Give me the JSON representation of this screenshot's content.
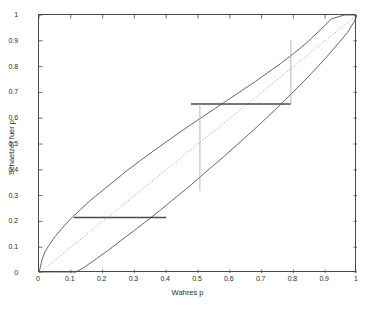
{
  "chart_data": {
    "type": "line",
    "title": "",
    "xlabel": "Wahres p",
    "ylabel": "Schaetzer fuer p",
    "xlim": [
      0,
      1
    ],
    "ylim": [
      0,
      1
    ],
    "grid": false,
    "legend": "none",
    "xticks": [
      "0",
      "0.1",
      "0.2",
      "0.3",
      "0.4",
      "0.5",
      "0.6",
      "0.7",
      "0.8",
      "0.9",
      "1"
    ],
    "xtick_values": [
      0,
      0.1,
      0.2,
      0.3,
      0.4,
      0.5,
      0.6,
      0.7,
      0.8,
      0.9,
      1
    ],
    "yticks": [
      "0",
      "0.1",
      "0.2",
      "0.3",
      "0.4",
      "0.5",
      "0.6",
      "0.7",
      "0.8",
      "0.9",
      "1"
    ],
    "ytick_values": [
      0,
      0.1,
      0.2,
      0.3,
      0.4,
      0.5,
      0.6,
      0.7,
      0.8,
      0.9,
      1
    ],
    "series": [
      {
        "name": "upper-confidence-bound",
        "style": "solid",
        "color": "#555555",
        "x": [
          0.0,
          0.01,
          0.02,
          0.03,
          0.05,
          0.07,
          0.1,
          0.13,
          0.16,
          0.2,
          0.24,
          0.28,
          0.32,
          0.36,
          0.4,
          0.44,
          0.48,
          0.52,
          0.56,
          0.6,
          0.64,
          0.68,
          0.72,
          0.76,
          0.8,
          0.84,
          0.88,
          0.92,
          0.96,
          1.0
        ],
        "y": [
          0.0,
          0.055,
          0.085,
          0.105,
          0.14,
          0.17,
          0.21,
          0.245,
          0.28,
          0.32,
          0.36,
          0.4,
          0.437,
          0.473,
          0.508,
          0.543,
          0.577,
          0.61,
          0.643,
          0.676,
          0.709,
          0.742,
          0.777,
          0.812,
          0.85,
          0.89,
          0.937,
          0.985,
          1.0,
          1.0
        ]
      },
      {
        "name": "lower-confidence-bound",
        "style": "solid",
        "color": "#555555",
        "x": [
          0.0,
          0.04,
          0.08,
          0.11,
          0.14,
          0.18,
          0.22,
          0.26,
          0.3,
          0.34,
          0.38,
          0.42,
          0.46,
          0.5,
          0.54,
          0.58,
          0.62,
          0.66,
          0.7,
          0.74,
          0.78,
          0.82,
          0.86,
          0.9,
          0.94,
          0.97,
          0.99,
          1.0
        ],
        "y": [
          0.0,
          0.0,
          0.0,
          0.0,
          0.02,
          0.055,
          0.09,
          0.128,
          0.165,
          0.203,
          0.242,
          0.283,
          0.323,
          0.365,
          0.408,
          0.45,
          0.494,
          0.538,
          0.583,
          0.63,
          0.678,
          0.727,
          0.778,
          0.831,
          0.888,
          0.932,
          0.972,
          1.0
        ]
      },
      {
        "name": "identity-line",
        "style": "dotted",
        "color": "#8c8c8c",
        "x": [
          0,
          1
        ],
        "y": [
          0,
          1
        ]
      }
    ],
    "annotations": [
      {
        "name": "lower-confidence-interval-segment",
        "type": "hline",
        "y": 0.215,
        "x_start": 0.11,
        "x_end": 0.4,
        "color": "#4a4a4a"
      },
      {
        "name": "upper-confidence-interval-segment",
        "type": "hline",
        "y": 0.655,
        "x_start": 0.478,
        "x_end": 0.792,
        "color": "#4a4a4a"
      },
      {
        "name": "left-vertical-reference-line",
        "type": "vline",
        "x": 0.506,
        "y_start": 0.318,
        "y_end": 0.655,
        "color": "#b0b0b0"
      },
      {
        "name": "right-vertical-reference-line",
        "type": "vline",
        "x": 0.792,
        "y_start": 0.655,
        "y_end": 0.903,
        "color": "#b0b0b0"
      }
    ]
  }
}
